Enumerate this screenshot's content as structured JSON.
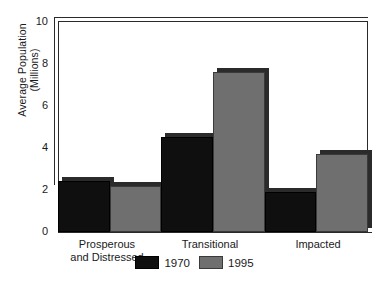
{
  "chart_data": {
    "type": "bar",
    "title": "",
    "subtitle": "",
    "xlabel": "",
    "ylabel": "Average Population (Millions)",
    "ylabel_line1": "Average Population",
    "ylabel_line2": "(Millions)",
    "categories": [
      "Prosperous and Distressed",
      "Transitional",
      "Impacted"
    ],
    "category_lines": [
      [
        "Prosperous",
        "and Distressed"
      ],
      [
        "Transitional"
      ],
      [
        "Impacted"
      ]
    ],
    "series": [
      {
        "name": "1970",
        "color": "#100f0f",
        "values": [
          2.4,
          4.5,
          1.9
        ]
      },
      {
        "name": "1995",
        "color": "#6f6f6f",
        "values": [
          2.2,
          7.6,
          3.7
        ]
      }
    ],
    "ylim": [
      0,
      10
    ],
    "yticks": [
      0,
      2,
      4,
      6,
      8,
      10
    ],
    "ytick_labels": [
      "0",
      "2",
      "4",
      "6",
      "8",
      "10"
    ],
    "grid": false,
    "legend_position": "bottom-center",
    "style": "3d-bar",
    "bar_gap": 0
  },
  "colors": {
    "series_1970": "#100f0f",
    "series_1995": "#6f6f6f",
    "frame": "#2a2a2a",
    "background": "#ffffff",
    "depth_shadow": "#2b2b2b"
  },
  "legend": {
    "items": [
      {
        "label": "1970",
        "swatch": "dark"
      },
      {
        "label": "1995",
        "swatch": "gray"
      }
    ]
  }
}
